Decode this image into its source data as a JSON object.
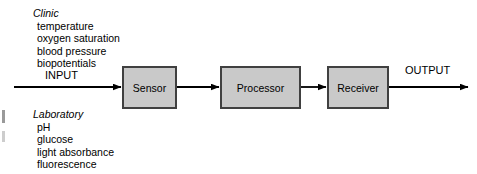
{
  "canvas": {
    "width": 477,
    "height": 174,
    "background": "#ffffff"
  },
  "style": {
    "node_fill": "#c9c9c9",
    "node_border": "#404040",
    "arrow_color": "#000000",
    "text_color": "#000000"
  },
  "flow": {
    "input_label": "INPUT",
    "output_label": "OUTPUT"
  },
  "nodes": [
    {
      "id": "sensor",
      "label": "Sensor"
    },
    {
      "id": "processor",
      "label": "Processor"
    },
    {
      "id": "receiver",
      "label": "Receiver"
    }
  ],
  "groups": [
    {
      "id": "clinic",
      "title": "Clinic",
      "items": [
        "temperature",
        "oxygen saturation",
        "blood pressure",
        "biopotentials"
      ]
    },
    {
      "id": "laboratory",
      "title": "Laboratory",
      "items": [
        "pH",
        "glucose",
        "light absorbance",
        "fluorescence"
      ]
    }
  ]
}
